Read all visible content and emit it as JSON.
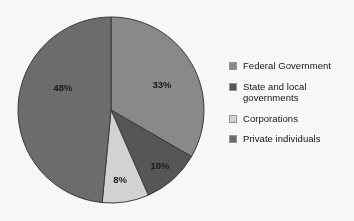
{
  "chart_data": {
    "type": "pie",
    "title": "",
    "subtitle": "",
    "xlabel": "",
    "ylabel": "",
    "legend_position": "right",
    "grid": false,
    "start_angle_deg": 0,
    "direction": "clockwise",
    "categories": [
      "Federal Government",
      "State and local governments",
      "Corporations",
      "Private individuals"
    ],
    "values": [
      33,
      10,
      8,
      48
    ],
    "value_labels": [
      "33%",
      "10%",
      "8%",
      "48%"
    ],
    "colors": [
      "#8c8c8c",
      "#585858",
      "#d7d7d7",
      "#6f6f6f"
    ],
    "annotations": []
  },
  "chart": {
    "center_x": 111,
    "center_y": 110,
    "radius": 93,
    "stroke": "#3b3b3b",
    "slices": [
      {
        "name": "Federal Government",
        "value": 33,
        "label": "33%",
        "color": "#8c8c8c",
        "label_x": 162,
        "label_y": 85
      },
      {
        "name": "State and local governments",
        "value": 10,
        "label": "10%",
        "color": "#585858",
        "label_x": 160,
        "label_y": 166
      },
      {
        "name": "Corporations",
        "value": 8,
        "label": "8%",
        "color": "#d7d7d7",
        "label_x": 120,
        "label_y": 180
      },
      {
        "name": "Private individuals",
        "value": 48,
        "label": "48%",
        "color": "#6f6f6f",
        "label_x": 63,
        "label_y": 88
      }
    ]
  },
  "legend": {
    "items": [
      {
        "label": "Federal Government",
        "color": "#8c8c8c"
      },
      {
        "label": "State and local\ngovernments",
        "color": "#585858"
      },
      {
        "label": "Corporations",
        "color": "#d7d7d7"
      },
      {
        "label": "Private individuals",
        "color": "#6f6f6f"
      }
    ]
  }
}
